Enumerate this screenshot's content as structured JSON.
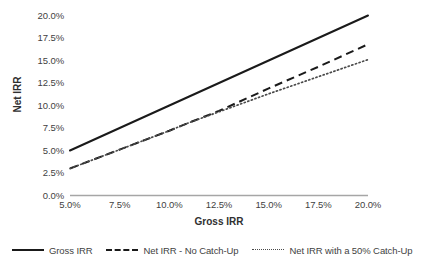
{
  "chart_data": {
    "type": "line",
    "title": "",
    "xlabel": "Gross IRR",
    "ylabel": "Net IRR",
    "xlim": [
      5.0,
      20.0
    ],
    "ylim": [
      0.0,
      20.0
    ],
    "grid": false,
    "legend_position": "bottom",
    "x": [
      5.0,
      7.5,
      10.0,
      11.0,
      12.5,
      15.0,
      17.5,
      20.0
    ],
    "xticks": [
      "5.0%",
      "7.5%",
      "10.0%",
      "12.5%",
      "15.0%",
      "17.5%",
      "20.0%"
    ],
    "yticks": [
      "0.0%",
      "2.5%",
      "5.0%",
      "7.5%",
      "10.0%",
      "12.5%",
      "15.0%",
      "17.5%",
      "20.0%"
    ],
    "series": [
      {
        "name": "Gross IRR",
        "style": "solid",
        "color": "#1a1a1a",
        "values": [
          5.0,
          7.5,
          10.0,
          11.0,
          12.5,
          15.0,
          17.5,
          20.0
        ]
      },
      {
        "name": "Net IRR - No Catch-Up",
        "style": "dashed",
        "color": "#1a1a1a",
        "values": [
          3.0,
          5.1,
          7.2,
          8.1,
          9.4,
          11.9,
          14.3,
          16.8
        ]
      },
      {
        "name": "Net IRR with a 50% Catch-Up",
        "style": "dotted",
        "color": "#4a4a4a",
        "values": [
          3.0,
          5.1,
          7.2,
          8.1,
          9.3,
          11.3,
          13.2,
          15.1
        ]
      }
    ]
  },
  "axes": {
    "y_title": "Net IRR",
    "x_title": "Gross IRR",
    "y_tick_labels": [
      "20.0%",
      "17.5%",
      "15.0%",
      "12.5%",
      "10.0%",
      "7.5%",
      "5.0%",
      "2.5%",
      "0.0%"
    ],
    "x_tick_labels": [
      "5.0%",
      "7.5%",
      "10.0%",
      "12.5%",
      "15.0%",
      "17.5%",
      "20.0%"
    ],
    "axis_line_color": "#a6a6a6"
  },
  "legend": {
    "items": [
      {
        "label": "Gross IRR",
        "style": "solid"
      },
      {
        "label": "Net IRR - No Catch-Up",
        "style": "dashed"
      },
      {
        "label": "Net IRR with a 50% Catch-Up",
        "style": "dotted"
      }
    ]
  }
}
